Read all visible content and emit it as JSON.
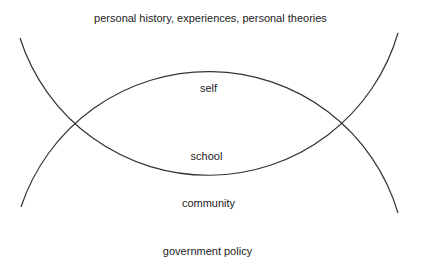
{
  "diagram": {
    "type": "nested-arc-diagram",
    "stroke_color": "#333333",
    "background_color": "#ffffff",
    "labels": {
      "outer_top": "personal history, experiences, personal theories",
      "self": "self",
      "school": "school",
      "community": "community",
      "government_policy": "government policy"
    },
    "arcs": [
      {
        "name": "upper-arc",
        "description": "concave-up arc enclosing self and school from above",
        "start": [
          20,
          38
        ],
        "lowest_point": [
          210,
          181
        ],
        "end": [
          398,
          33
        ]
      },
      {
        "name": "lower-arc",
        "description": "convex-up arc enclosing self and school from below",
        "start": [
          21,
          207
        ],
        "highest_point": [
          210,
          67
        ],
        "end": [
          398,
          213
        ]
      }
    ],
    "intersections": [
      [
        68,
        125
      ],
      [
        350,
        125
      ]
    ]
  }
}
